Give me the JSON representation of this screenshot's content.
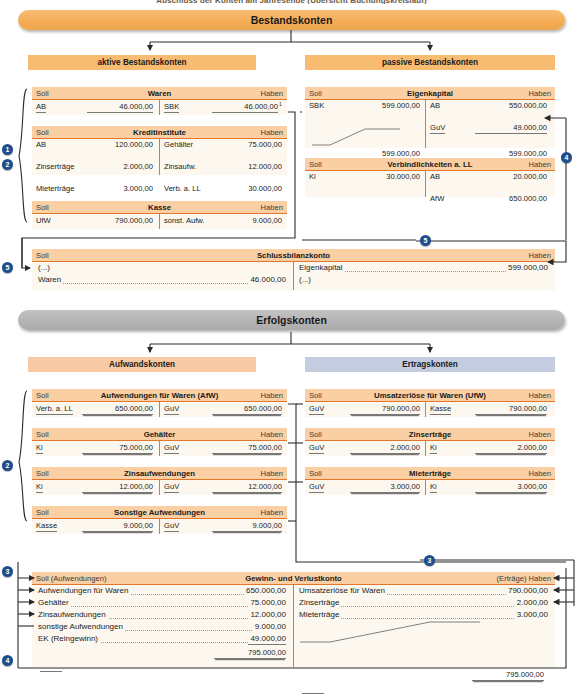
{
  "caption": "Abschluss der Konten am Jahresende (Übersicht Buchungskreislauf)",
  "sections": {
    "bestandskonten": "Bestandskonten",
    "erfolgskonten": "Erfolgskonten"
  },
  "subheaders": {
    "aktive": "aktive Bestandskonten",
    "passive": "passive Bestandskonten",
    "aufwand": "Aufwandskonten",
    "ertrag": "Ertragskonten"
  },
  "labels": {
    "soll": "Soll",
    "haben": "Haben",
    "soll_aufwendungen": "Soll (Aufwendungen)",
    "ertraege_haben": "(Erträge) Haben"
  },
  "markers": [
    "1",
    "2",
    "3",
    "4",
    "5"
  ],
  "colors": {
    "banner_orange": "#f3ad57",
    "banner_grey": "#b4b4b4",
    "subbar_orange": "#f7bb72",
    "subbar_peach": "#f8c9a5",
    "subbar_blue": "#c3cddf",
    "acct_header": "#f9cfa3",
    "acct_rule": "#e2762a",
    "acct_body": "#fdf8ef",
    "marker": "#1f4e8c"
  },
  "accounts": {
    "waren": {
      "name": "Waren",
      "rows": [
        {
          "d_txt": "AB",
          "d_num": "46.000,00",
          "c_txt": "SBK",
          "c_num": "46.000,00",
          "c_sup": "1",
          "ul": true
        }
      ]
    },
    "kreditinstitute": {
      "name": "Kreditinstitute",
      "rows": [
        {
          "d_txt": "AB",
          "d_num": "120.000,00",
          "c_txt": "Gehälter",
          "c_num": "75.000,00"
        },
        {
          "d_txt": "Zinserträge",
          "d_num": "2.000,00",
          "c_txt": "Zinsaufw.",
          "c_num": "12.000,00"
        },
        {
          "d_txt": "Mieterträge",
          "d_num": "3.000,00",
          "c_txt": "Verb. a. LL",
          "c_num": "30.000,00"
        }
      ]
    },
    "kasse": {
      "name": "Kasse",
      "rows": [
        {
          "d_txt": "UfW",
          "d_num": "790.000,00",
          "c_txt": "sonst. Aufw.",
          "c_num": "9.000,00"
        }
      ]
    },
    "eigenkapital": {
      "name": "Eigenkapital",
      "rows": [
        {
          "d_txt": "SBK",
          "d_num": "599.000,00",
          "c_txt": "AB",
          "c_num": "550.000,00"
        },
        {
          "d_txt": "",
          "d_num": "",
          "c_txt": "GuV",
          "c_num": "49.000,00",
          "c_ul": true
        }
      ],
      "totals": {
        "debit": "599.000,00",
        "credit": "599.000,00"
      }
    },
    "verbindlichkeiten": {
      "name": "Verbindlichkeiten a. LL",
      "rows": [
        {
          "d_txt": "Ki",
          "d_num": "30.000,00",
          "c_txt": "AB",
          "c_num": "20.000,00"
        },
        {
          "d_txt": "",
          "d_num": "",
          "c_txt": "AfW",
          "c_num": "650.000,00"
        }
      ]
    },
    "schlussbilanz": {
      "name": "Schlussbilanzkonto",
      "debit": [
        {
          "label": "(...)",
          "value": "",
          "dots": false
        },
        {
          "label": "Waren",
          "value": "46.000,00",
          "dots": true
        }
      ],
      "credit": [
        {
          "label": "Eigenkapital",
          "value": "599.000,00",
          "dots": true
        },
        {
          "label": "(...)",
          "value": "",
          "dots": false
        }
      ]
    },
    "afw": {
      "name": "Aufwendungen für Waren (AfW)",
      "rows": [
        {
          "d_txt": "Verb. a. LL",
          "d_num": "650.000,00",
          "c_txt": "GuV",
          "c_num": "650.000,00",
          "ul": true
        }
      ]
    },
    "gehaelter": {
      "name": "Gehälter",
      "rows": [
        {
          "d_txt": "Ki",
          "d_num": "75.000,00",
          "c_txt": "GuV",
          "c_num": "75.000,00",
          "ul": true
        }
      ]
    },
    "zinsaufwendungen": {
      "name": "Zinsaufwendungen",
      "rows": [
        {
          "d_txt": "Ki",
          "d_num": "12.000,00",
          "c_txt": "GuV",
          "c_num": "12.000,00",
          "ul": true
        }
      ]
    },
    "sonstige_aufwendungen": {
      "name": "Sonstige Aufwendungen",
      "rows": [
        {
          "d_txt": "Kasse",
          "d_num": "9.000,00",
          "c_txt": "GuV",
          "c_num": "9.000,00",
          "ul": true
        }
      ]
    },
    "ufw": {
      "name": "Umsatzerlöse für Waren (UfW)",
      "rows": [
        {
          "d_txt": "GuV",
          "d_num": "790.000,00",
          "c_txt": "Kasse",
          "c_num": "790.000,00",
          "ul": true
        }
      ]
    },
    "zinsertraege": {
      "name": "Zinserträge",
      "rows": [
        {
          "d_txt": "GuV",
          "d_num": "2.000,00",
          "c_txt": "Ki",
          "c_num": "2.000,00",
          "ul": true
        }
      ]
    },
    "mietertraege": {
      "name": "Mieterträge",
      "rows": [
        {
          "d_txt": "GuV",
          "d_num": "3.000,00",
          "c_txt": "Ki",
          "c_num": "3.000,00",
          "ul": true
        }
      ]
    },
    "guv": {
      "name": "Gewinn- und Verlustkonto",
      "debit": [
        {
          "label": "Aufwendungen für Waren",
          "value": "650.000,00"
        },
        {
          "label": "Gehälter",
          "value": "75.000,00"
        },
        {
          "label": "Zinsaufwendungen",
          "value": "12.000,00"
        },
        {
          "label": "sonstige Aufwendungen",
          "value": "9.000,00"
        },
        {
          "label": "EK (Reingewinn)",
          "value": "49.000,00"
        }
      ],
      "credit": [
        {
          "label": "Umsatzerlöse für Waren",
          "value": "790.000,00"
        },
        {
          "label": "Zinserträge",
          "value": "2.000,00"
        },
        {
          "label": "Mieterträge",
          "value": "3.000,00"
        }
      ],
      "totals": {
        "debit": "795.000,00",
        "credit": "795.000,00"
      }
    }
  }
}
